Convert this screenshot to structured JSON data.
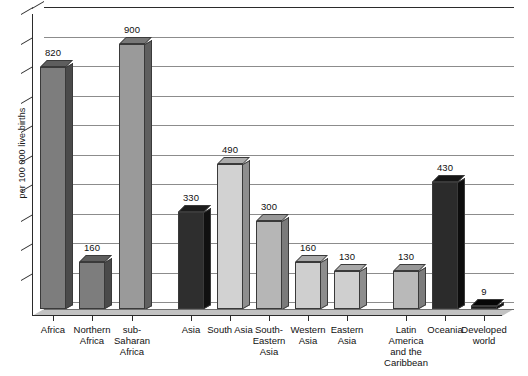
{
  "chart_data": {
    "type": "bar",
    "title": "",
    "subtitle": "",
    "xlabel": "",
    "ylabel": "per 100 000 live births",
    "ylim": [
      0,
      1000
    ],
    "grid": true,
    "gridline_step": 100,
    "legend": "none",
    "style": "3d-bar",
    "categories": [
      "Africa",
      "Northern Africa",
      "sub-Saharan Africa",
      "Asia",
      "South Asia",
      "South-Eastern Asia",
      "Western Asia",
      "Eastern Asia",
      "Latin America and the Caribbean",
      "Oceania",
      "Developed world"
    ],
    "category_label_lines": [
      [
        "Africa"
      ],
      [
        "Northern",
        "Africa"
      ],
      [
        "sub-",
        "Saharan",
        "Africa"
      ],
      [
        "Asia"
      ],
      [
        "South Asia"
      ],
      [
        "South-",
        "Eastern",
        "Asia"
      ],
      [
        "Western",
        "Asia"
      ],
      [
        "Eastern",
        "Asia"
      ],
      [
        "Latin",
        "America",
        "and the",
        "Caribbean"
      ],
      [
        "Oceania"
      ],
      [
        "Developed",
        "world"
      ]
    ],
    "values": [
      820,
      160,
      900,
      330,
      490,
      300,
      160,
      130,
      130,
      430,
      9
    ],
    "value_labels": [
      "820",
      "160",
      "900",
      "330",
      "490",
      "300",
      "160",
      "130",
      "130",
      "430",
      "9"
    ],
    "bar_colors": [
      "#7d7d7d",
      "#7d7d7d",
      "#9a9a9a",
      "#2e2e2e",
      "#d2d2d2",
      "#b6b6b6",
      "#cfcfcf",
      "#cfcfcf",
      "#b9b9b9",
      "#2b2b2b",
      "#1c1c1c"
    ],
    "bar_side_colors": [
      "#4a4a4a",
      "#4a4a4a",
      "#5f5f5f",
      "#101010",
      "#8f8f8f",
      "#7b7b7b",
      "#8d8d8d",
      "#8d8d8d",
      "#7c7c7c",
      "#0d0d0d",
      "#000000"
    ],
    "bar_top_colors": [
      "#5e5e5e",
      "#5e5e5e",
      "#787878",
      "#1c1c1c",
      "#ababab",
      "#989898",
      "#a8a8a8",
      "#a8a8a8",
      "#979797",
      "#161616",
      "#070707"
    ]
  },
  "colors": {
    "background": "#ffffff",
    "axis": "#2b2b2b",
    "gridline": "#8c8c8c",
    "floor": "#c2c2c2",
    "text": "#111111"
  }
}
